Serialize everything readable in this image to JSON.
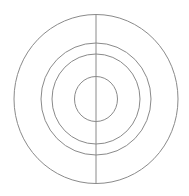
{
  "diagram": {
    "type": "concentric-circles",
    "background": "#ffffff",
    "stroke_color": "#8a8a8a",
    "stroke_width": 1,
    "center": {
      "x": 96,
      "y": 99
    },
    "circles": [
      {
        "name": "outer",
        "rx": 82,
        "ry": 84.5
      },
      {
        "name": "second",
        "rx": 55,
        "ry": 56
      },
      {
        "name": "third",
        "rx": 44,
        "ry": 45
      },
      {
        "name": "inner",
        "rx": 21.5,
        "ry": 22.5
      }
    ],
    "vertical_line": {
      "x": 96,
      "y1": 15,
      "y2": 184
    }
  }
}
